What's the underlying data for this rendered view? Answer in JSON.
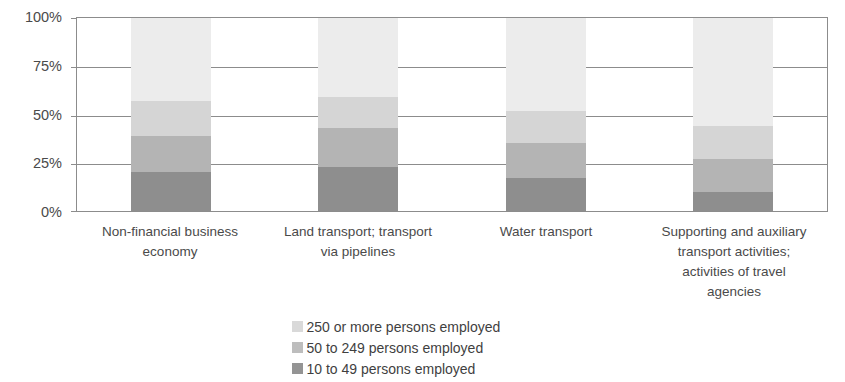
{
  "title_faint": "",
  "chart_data": {
    "type": "bar",
    "subtype": "stacked-percentage-column",
    "title": "",
    "subtitle": "",
    "xlabel": "",
    "ylabel": "",
    "ylim": [
      0,
      100
    ],
    "yticks": [
      0,
      25,
      50,
      75,
      100
    ],
    "ytick_labels": [
      "0%",
      "25%",
      "50%",
      "75%",
      "100%"
    ],
    "grid": true,
    "legend_position": "bottom-center",
    "categories": [
      "Non-financial business economy",
      "Land transport; transport via pipelines",
      "Water transport",
      "Supporting and auxiliary transport activities; activities of travel agencies"
    ],
    "category_lines": [
      [
        "Non-financial business",
        "economy"
      ],
      [
        "Land transport; transport",
        "via pipelines"
      ],
      [
        "Water transport"
      ],
      [
        "Supporting and auxiliary",
        "transport activities;",
        "activities of travel",
        "agencies"
      ]
    ],
    "series": [
      {
        "name": "10 to 49 persons employed",
        "color": "#8e8e8e",
        "values": [
          20,
          23,
          17,
          10
        ]
      },
      {
        "name": "50 to 249 persons employed",
        "color": "#b4b4b4",
        "values": [
          19,
          20,
          18,
          17
        ]
      },
      {
        "name": "250 or more persons employed",
        "color": "#d5d5d5",
        "values": [
          18,
          16,
          17,
          17
        ]
      },
      {
        "name": "remainder",
        "color": "#ececec",
        "values": [
          43,
          41,
          48,
          56
        ]
      }
    ],
    "legend_entries": [
      {
        "label": "250 or more persons employed",
        "color": "#d9d9d9"
      },
      {
        "label": "50 to 249 persons employed",
        "color": "#bdbdbd"
      },
      {
        "label": "10 to 49 persons employed",
        "color": "#949494"
      }
    ],
    "colors": {
      "axis": "#8c8c8c",
      "text": "#4a4a4a",
      "background": "#ffffff",
      "seg_top": "#ececec",
      "seg_upper_mid": "#d5d5d5",
      "seg_lower_mid": "#b4b4b4",
      "seg_bottom": "#8e8e8e"
    }
  },
  "yaxis": {
    "labels": [
      "100%",
      "75%",
      "50%",
      "25%",
      "0%"
    ]
  }
}
